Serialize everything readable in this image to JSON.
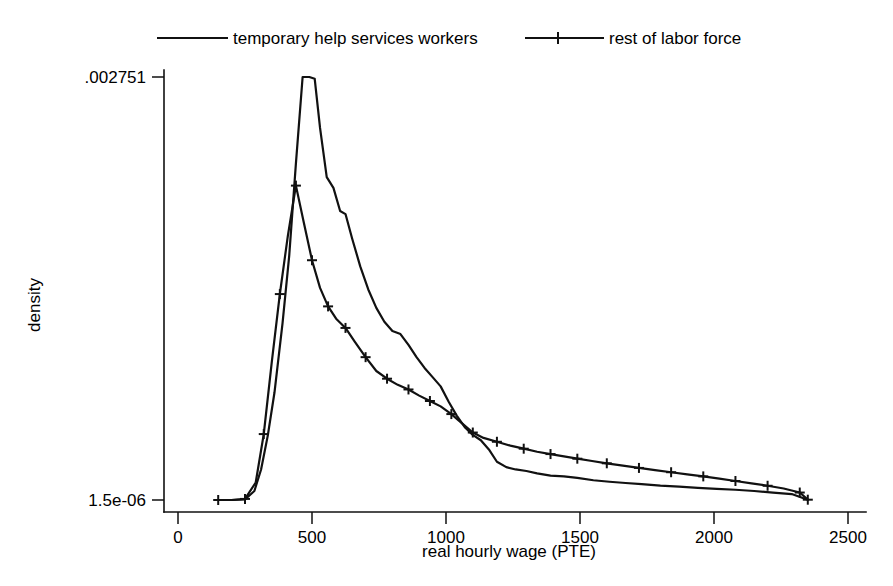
{
  "chart_data": {
    "type": "line",
    "title": "",
    "xlabel": "real hourly wage (PTE)",
    "ylabel": "density",
    "xlim": [
      0,
      2500
    ],
    "ylim": [
      1.5e-06,
      0.002751
    ],
    "xticks": [
      0,
      500,
      1000,
      1500,
      2000,
      2500
    ],
    "xtick_labels": [
      "0",
      "500",
      "1000",
      "1500",
      "2000",
      "2500"
    ],
    "yticks": [
      1.5e-06,
      0.002751
    ],
    "ytick_labels": [
      "1.5e-06",
      ".002751"
    ],
    "grid": false,
    "legend_position": "top",
    "legend": [
      "temporary help services workers",
      "rest of labor force"
    ],
    "series": [
      {
        "name": "temporary help services workers",
        "marker": "none",
        "x": [
          150,
          200,
          250,
          285,
          310,
          335,
          360,
          390,
          415,
          440,
          465,
          490,
          510,
          530,
          555,
          580,
          605,
          625,
          650,
          680,
          710,
          740,
          770,
          800,
          830,
          860,
          890,
          920,
          950,
          980,
          1010,
          1040,
          1070,
          1100,
          1130,
          1160,
          1190,
          1225,
          1260,
          1300,
          1340,
          1390,
          1440,
          1490,
          1550,
          1610,
          1670,
          1730,
          1800,
          1870,
          1940,
          2010,
          2080,
          2150,
          2220,
          2290,
          2350
        ],
        "y": [
          1.5e-06,
          1.5e-06,
          4.6e-06,
          6e-05,
          0.0002,
          0.00042,
          0.0007,
          0.00115,
          0.00159,
          0.00219,
          0.002751,
          0.002751,
          0.00274,
          0.00242,
          0.0021,
          0.00203,
          0.00188,
          0.00186,
          0.0017,
          0.00152,
          0.00137,
          0.00125,
          0.00116,
          0.0011,
          0.00108,
          0.00101,
          0.00093,
          0.00086,
          0.0008,
          0.00074,
          0.00064,
          0.00055,
          0.000475,
          0.000425,
          0.00039,
          0.00033,
          0.00025,
          0.000215,
          0.0002,
          0.00019,
          0.000175,
          0.00016,
          0.000155,
          0.000145,
          0.00013,
          0.00012,
          0.000112,
          0.000105,
          9.5e-05,
          8.8e-05,
          8e-05,
          7.4e-05,
          6.8e-05,
          6e-05,
          5e-05,
          4e-05,
          3.5e-06
        ]
      },
      {
        "name": "rest of labor force",
        "marker": "plus",
        "x": [
          150,
          200,
          250,
          290,
          320,
          350,
          380,
          410,
          440,
          470,
          500,
          530,
          560,
          590,
          625,
          660,
          700,
          740,
          780,
          820,
          860,
          900,
          940,
          980,
          1020,
          1060,
          1100,
          1140,
          1190,
          1240,
          1290,
          1340,
          1390,
          1440,
          1490,
          1545,
          1600,
          1660,
          1720,
          1780,
          1840,
          1900,
          1960,
          2020,
          2080,
          2140,
          2200,
          2260,
          2320,
          2350
        ],
        "y": [
          1.5e-06,
          1.5e-06,
          8.5e-06,
          0.000115,
          0.00043,
          0.0009,
          0.00134,
          0.00172,
          0.002045,
          0.0018,
          0.00156,
          0.00138,
          0.00126,
          0.00118,
          0.00112,
          0.00103,
          0.00093,
          0.00084,
          0.00079,
          0.00075,
          0.00072,
          0.00068,
          0.000645,
          0.00061,
          0.00056,
          0.0005,
          0.00044,
          0.000405,
          0.00038,
          0.000355,
          0.000335,
          0.000315,
          0.0003,
          0.000285,
          0.00027,
          0.000255,
          0.00024,
          0.000225,
          0.00021,
          0.000196,
          0.000182,
          0.000168,
          0.000155,
          0.00014,
          0.000125,
          0.00011,
          9.4e-05,
          7.6e-05,
          5e-05,
          3.5e-06
        ]
      }
    ]
  },
  "axes": {
    "x_title": "real hourly wage (PTE)",
    "y_title": "density",
    "y_top_label": ".002751",
    "y_bottom_label": "1.5e-06",
    "x_labels": [
      "0",
      "500",
      "1000",
      "1500",
      "2000",
      "2500"
    ]
  },
  "legend": {
    "entry_1": "temporary help services workers",
    "entry_2": "rest of labor force"
  },
  "colors": {
    "ink": "#111111",
    "background": "#ffffff"
  }
}
